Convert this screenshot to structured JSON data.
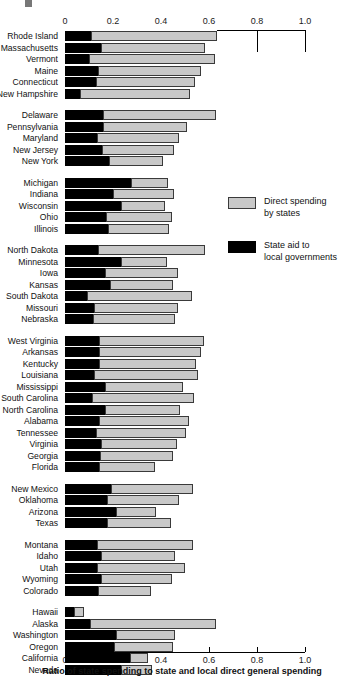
{
  "axis": {
    "tick_labels": [
      "0",
      "0.2",
      "0.4",
      "0.6",
      "0.8",
      "1.0"
    ],
    "tick_values": [
      0,
      0.2,
      0.4,
      0.6,
      0.8,
      1.0
    ],
    "xlabel": "Ratio of state spending to state and local direct general spending",
    "xmin": 0,
    "xmax": 1.0
  },
  "legend": {
    "items": [
      {
        "label": "Direct spending by states",
        "line1": "Direct spending",
        "line2": "by states",
        "color": "#c8c8c8",
        "key": "direct"
      },
      {
        "label": "State aid to local governments",
        "line1": "State aid to",
        "line2": "local governments",
        "color": "#000000",
        "key": "aid"
      }
    ]
  },
  "colors": {
    "direct_spending": "#c8c8c8",
    "state_aid": "#000000",
    "axis": "#000000",
    "text": "#111111"
  },
  "chart_data": {
    "type": "bar",
    "orientation": "horizontal",
    "stacked": true,
    "title": "",
    "xlabel": "Ratio of state spending to state and local direct general spending",
    "ylabel": "",
    "xlim": [
      0,
      1.0
    ],
    "xticks": [
      0,
      0.2,
      0.4,
      0.6,
      0.8,
      1.0
    ],
    "grid": false,
    "legend_position": "right-middle",
    "series": [
      {
        "name": "State aid to local governments",
        "color": "#000000"
      },
      {
        "name": "Direct spending by states",
        "color": "#c8c8c8"
      }
    ],
    "groups": [
      {
        "name": "New England",
        "rows": [
          {
            "category": "Rhode Island",
            "aid": 0.11,
            "direct": 0.525,
            "total": 0.635
          },
          {
            "category": "Massachusetts",
            "aid": 0.148,
            "direct": 0.437,
            "total": 0.585
          },
          {
            "category": "Vermont",
            "aid": 0.098,
            "direct": 0.527,
            "total": 0.625
          },
          {
            "category": "Maine",
            "aid": 0.136,
            "direct": 0.429,
            "total": 0.565
          },
          {
            "category": "Connecticut",
            "aid": 0.13,
            "direct": 0.412,
            "total": 0.542
          },
          {
            "category": "New Hampshire",
            "aid": 0.062,
            "direct": 0.458,
            "total": 0.52
          }
        ]
      },
      {
        "name": "Mid-Atlantic",
        "rows": [
          {
            "category": "Delaware",
            "aid": 0.16,
            "direct": 0.47,
            "total": 0.63
          },
          {
            "category": "Pennsylvania",
            "aid": 0.16,
            "direct": 0.348,
            "total": 0.508
          },
          {
            "category": "Maryland",
            "aid": 0.135,
            "direct": 0.34,
            "total": 0.475
          },
          {
            "category": "New Jersey",
            "aid": 0.155,
            "direct": 0.3,
            "total": 0.455
          },
          {
            "category": "New York",
            "aid": 0.185,
            "direct": 0.225,
            "total": 0.41
          }
        ]
      },
      {
        "name": "Great Lakes",
        "rows": [
          {
            "category": "Michigan",
            "aid": 0.275,
            "direct": 0.155,
            "total": 0.43
          },
          {
            "category": "Indiana",
            "aid": 0.2,
            "direct": 0.255,
            "total": 0.455
          },
          {
            "category": "Wisconsin",
            "aid": 0.235,
            "direct": 0.18,
            "total": 0.415
          },
          {
            "category": "Ohio",
            "aid": 0.172,
            "direct": 0.273,
            "total": 0.445
          },
          {
            "category": "Illinois",
            "aid": 0.18,
            "direct": 0.255,
            "total": 0.435
          }
        ]
      },
      {
        "name": "Plains",
        "rows": [
          {
            "category": "North Dakota",
            "aid": 0.138,
            "direct": 0.447,
            "total": 0.585
          },
          {
            "category": "Minnesota",
            "aid": 0.235,
            "direct": 0.19,
            "total": 0.425
          },
          {
            "category": "Iowa",
            "aid": 0.165,
            "direct": 0.305,
            "total": 0.47
          },
          {
            "category": "Kansas",
            "aid": 0.188,
            "direct": 0.262,
            "total": 0.45
          },
          {
            "category": "South Dakota",
            "aid": 0.09,
            "direct": 0.44,
            "total": 0.53
          },
          {
            "category": "Missouri",
            "aid": 0.12,
            "direct": 0.35,
            "total": 0.47
          },
          {
            "category": "Nebraska",
            "aid": 0.118,
            "direct": 0.342,
            "total": 0.46
          }
        ]
      },
      {
        "name": "South",
        "rows": [
          {
            "category": "West Virginia",
            "aid": 0.14,
            "direct": 0.44,
            "total": 0.58
          },
          {
            "category": "Arkansas",
            "aid": 0.14,
            "direct": 0.425,
            "total": 0.565
          },
          {
            "category": "Kentucky",
            "aid": 0.143,
            "direct": 0.402,
            "total": 0.545
          },
          {
            "category": "Louisiana",
            "aid": 0.12,
            "direct": 0.435,
            "total": 0.555
          },
          {
            "category": "Mississippi",
            "aid": 0.168,
            "direct": 0.322,
            "total": 0.49
          },
          {
            "category": "South Carolina",
            "aid": 0.113,
            "direct": 0.425,
            "total": 0.538
          },
          {
            "category": "North Carolina",
            "aid": 0.165,
            "direct": 0.315,
            "total": 0.48
          },
          {
            "category": "Alabama",
            "aid": 0.14,
            "direct": 0.375,
            "total": 0.515
          },
          {
            "category": "Tennessee",
            "aid": 0.128,
            "direct": 0.377,
            "total": 0.505
          },
          {
            "category": "Virginia",
            "aid": 0.148,
            "direct": 0.317,
            "total": 0.465
          },
          {
            "category": "Georgia",
            "aid": 0.145,
            "direct": 0.305,
            "total": 0.45
          },
          {
            "category": "Florida",
            "aid": 0.14,
            "direct": 0.235,
            "total": 0.375
          }
        ]
      },
      {
        "name": "Southwest",
        "rows": [
          {
            "category": "New Mexico",
            "aid": 0.193,
            "direct": 0.342,
            "total": 0.535
          },
          {
            "category": "Oklahoma",
            "aid": 0.175,
            "direct": 0.3,
            "total": 0.475
          },
          {
            "category": "Arizona",
            "aid": 0.212,
            "direct": 0.168,
            "total": 0.38
          },
          {
            "category": "Texas",
            "aid": 0.175,
            "direct": 0.265,
            "total": 0.44
          }
        ]
      },
      {
        "name": "Mountain",
        "rows": [
          {
            "category": "Montana",
            "aid": 0.132,
            "direct": 0.403,
            "total": 0.535
          },
          {
            "category": "Idaho",
            "aid": 0.152,
            "direct": 0.308,
            "total": 0.46
          },
          {
            "category": "Utah",
            "aid": 0.135,
            "direct": 0.365,
            "total": 0.5
          },
          {
            "category": "Wyoming",
            "aid": 0.152,
            "direct": 0.293,
            "total": 0.445
          },
          {
            "category": "Colorado",
            "aid": 0.138,
            "direct": 0.222,
            "total": 0.36
          }
        ]
      },
      {
        "name": "Pacific",
        "rows": [
          {
            "category": "Hawaii",
            "aid": 0.038,
            "direct": 0.04,
            "total": 0.078
          },
          {
            "category": "Alaska",
            "aid": 0.105,
            "direct": 0.525,
            "total": 0.63
          },
          {
            "category": "Washington",
            "aid": 0.212,
            "direct": 0.245,
            "total": 0.457
          },
          {
            "category": "Oregon",
            "aid": 0.205,
            "direct": 0.245,
            "total": 0.45
          },
          {
            "category": "California",
            "aid": 0.272,
            "direct": 0.075,
            "total": 0.347
          },
          {
            "category": "Nevada",
            "aid": 0.235,
            "direct": 0.128,
            "total": 0.363
          }
        ]
      },
      {
        "name": "National",
        "rows": [
          {
            "category": "US",
            "aid": 0.2,
            "direct": 0.23,
            "total": 0.43
          }
        ]
      }
    ]
  }
}
